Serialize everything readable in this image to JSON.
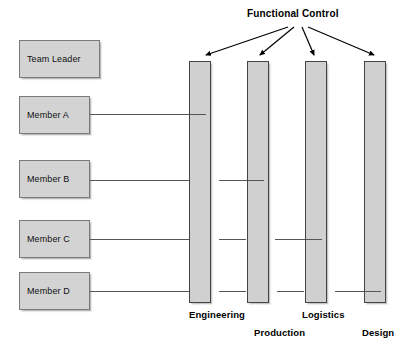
{
  "diagram": {
    "title": "Functional Control",
    "title_pos": {
      "x": 247,
      "y": 8
    },
    "arrow_origin": {
      "x": 300,
      "y": 27
    },
    "roles": [
      {
        "id": "team-leader",
        "label": "Team Leader",
        "x": 19,
        "y": 40,
        "w": 81,
        "h": 38,
        "has_connector": false,
        "connector_y": 0
      },
      {
        "id": "member-a",
        "label": "Member A",
        "x": 19,
        "y": 96,
        "w": 71,
        "h": 38,
        "has_connector": true,
        "connector_y": 114
      },
      {
        "id": "member-b",
        "label": "Member B",
        "x": 19,
        "y": 160,
        "w": 71,
        "h": 38,
        "has_connector": true,
        "connector_y": 180
      },
      {
        "id": "member-c",
        "label": "Member C",
        "x": 19,
        "y": 220,
        "w": 71,
        "h": 38,
        "has_connector": true,
        "connector_y": 239
      },
      {
        "id": "member-d",
        "label": "Member D",
        "x": 19,
        "y": 272,
        "w": 71,
        "h": 38,
        "has_connector": true,
        "connector_y": 291
      }
    ],
    "columns": [
      {
        "id": "engineering",
        "label": "Engineering",
        "x": 189,
        "y": 61,
        "w": 22,
        "h": 242,
        "label_x": 189,
        "label_y": 309,
        "arrow_tip": {
          "x": 205,
          "y": 58
        }
      },
      {
        "id": "production",
        "label": "Production",
        "x": 247,
        "y": 61,
        "w": 22,
        "h": 242,
        "label_x": 254,
        "label_y": 327,
        "arrow_tip": {
          "x": 259,
          "y": 58
        }
      },
      {
        "id": "logistics",
        "label": "Logistics",
        "x": 305,
        "y": 61,
        "w": 22,
        "h": 242,
        "label_x": 302,
        "label_y": 309,
        "arrow_tip": {
          "x": 313,
          "y": 58
        }
      },
      {
        "id": "design",
        "label": "Design",
        "x": 364,
        "y": 61,
        "w": 22,
        "h": 242,
        "label_x": 362,
        "label_y": 327,
        "arrow_tip": {
          "x": 375,
          "y": 58
        }
      }
    ],
    "connectors": [
      {
        "member": "member-a",
        "y": 114,
        "segments": [
          {
            "x1": 90,
            "x2": 206
          }
        ]
      },
      {
        "member": "member-b",
        "y": 180,
        "segments": [
          {
            "x1": 90,
            "x2": 196
          },
          {
            "x1": 219,
            "x2": 264
          }
        ]
      },
      {
        "member": "member-c",
        "y": 239,
        "segments": [
          {
            "x1": 90,
            "x2": 193
          },
          {
            "x1": 219,
            "x2": 246
          },
          {
            "x1": 275,
            "x2": 322
          }
        ]
      },
      {
        "member": "member-d",
        "y": 291,
        "segments": [
          {
            "x1": 90,
            "x2": 190
          },
          {
            "x1": 219,
            "x2": 246
          },
          {
            "x1": 277,
            "x2": 304
          },
          {
            "x1": 335,
            "x2": 381
          }
        ]
      }
    ],
    "colors": {
      "box_fill": "#d3d3d3",
      "box_border": "#7a7a7a",
      "bar_fill": "#d0d0d0",
      "bar_border": "#444444",
      "line": "#555555",
      "arrow": "#000000",
      "text": "#000000",
      "background": "#ffffff"
    }
  }
}
